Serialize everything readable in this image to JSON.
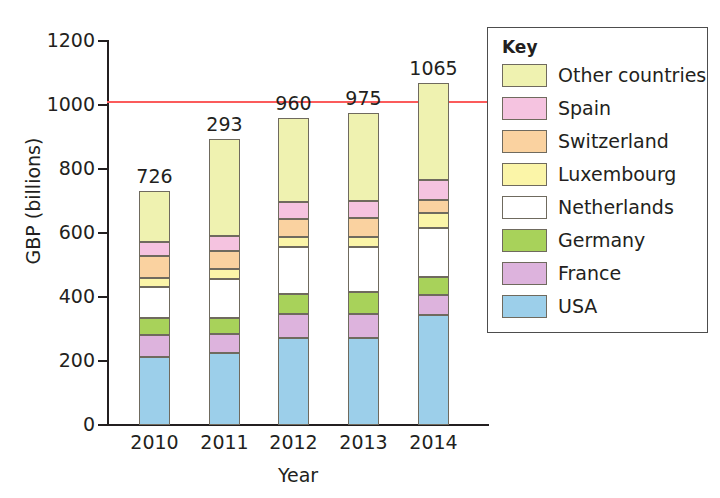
{
  "chart_data": {
    "type": "bar",
    "subtype": "stacked-vertical",
    "title": "",
    "xlabel": "Year",
    "ylabel": "GBP (billions)",
    "categories": [
      "2010",
      "2011",
      "2012",
      "2013",
      "2014"
    ],
    "ylim": [
      0,
      1200
    ],
    "ytick_values": [
      0,
      200,
      400,
      600,
      800,
      1000,
      1200
    ],
    "ytick_labels": [
      "0",
      "200",
      "400",
      "600",
      "800",
      "1000",
      "1200"
    ],
    "grid": false,
    "legend_position": "right-outside",
    "legend_title": "Key",
    "bar_total_labels": [
      "726",
      "293",
      "960",
      "975",
      "1065"
    ],
    "reference_line": {
      "value": 1000,
      "color": "#fb5b5b",
      "label": ""
    },
    "series": [
      {
        "name": "USA",
        "color": "#9ccfea",
        "values": [
          213,
          225,
          272,
          272,
          344
        ]
      },
      {
        "name": "France",
        "color": "#ddb3dd",
        "values": [
          68,
          60,
          75,
          75,
          62
        ]
      },
      {
        "name": "Germany",
        "color": "#a8d25a",
        "values": [
          53,
          50,
          63,
          68,
          57
        ]
      },
      {
        "name": "Netherlands",
        "color": "#ffffff",
        "values": [
          97,
          122,
          147,
          140,
          153
        ]
      },
      {
        "name": "Luxembourg",
        "color": "#fbf5a8",
        "values": [
          28,
          31,
          31,
          34,
          47
        ]
      },
      {
        "name": "Switzerland",
        "color": "#fad2a0",
        "values": [
          69,
          56,
          56,
          59,
          40
        ]
      },
      {
        "name": "Spain",
        "color": "#f5c3e0",
        "values": [
          44,
          47,
          53,
          53,
          63
        ]
      },
      {
        "name": "Other countries",
        "color": "#eff2b0",
        "values": [
          159,
          302,
          263,
          274,
          303
        ]
      }
    ],
    "stack_order_bottom_to_top": [
      "USA",
      "France",
      "Germany",
      "Netherlands",
      "Luxembourg",
      "Switzerland",
      "Spain",
      "Other countries"
    ]
  },
  "axes": {
    "y_title": "GBP (billions)",
    "x_title": "Year",
    "y_ticks": [
      "1200",
      "1000",
      "800",
      "600",
      "400",
      "200",
      "0"
    ],
    "x_ticks": [
      "2010",
      "2011",
      "2012",
      "2013",
      "2014"
    ]
  },
  "totals": {
    "b0": "726",
    "b1": "293",
    "b2": "960",
    "b3": "975",
    "b4": "1065"
  },
  "legend": {
    "title": "Key",
    "items": [
      {
        "label": "Other countries",
        "color": "#eff2b0"
      },
      {
        "label": "Spain",
        "color": "#f5c3e0"
      },
      {
        "label": "Switzerland",
        "color": "#fad2a0"
      },
      {
        "label": "Luxembourg",
        "color": "#fbf5a8"
      },
      {
        "label": "Netherlands",
        "color": "#ffffff"
      },
      {
        "label": "Germany",
        "color": "#a8d25a"
      },
      {
        "label": "France",
        "color": "#ddb3dd"
      },
      {
        "label": "USA",
        "color": "#9ccfea"
      }
    ]
  }
}
